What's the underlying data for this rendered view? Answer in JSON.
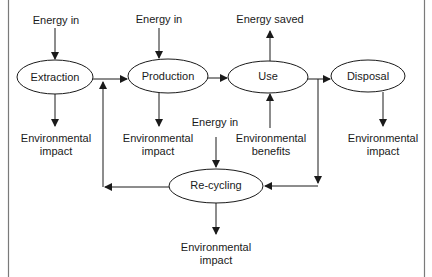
{
  "diagram": {
    "type": "flow",
    "nodes": {
      "extraction": "Extraction",
      "production": "Production",
      "use": "Use",
      "disposal": "Disposal",
      "recycling": "Re-cycling"
    },
    "labels": {
      "energy_in_extraction": "Energy in",
      "energy_in_production": "Energy in",
      "energy_in_recycling": "Energy in",
      "energy_saved": "Energy saved",
      "env_impact_extraction": [
        "Environmental",
        "impact"
      ],
      "env_impact_production": [
        "Environmental",
        "impact"
      ],
      "env_benefits_use": [
        "Environmental",
        "benefits"
      ],
      "env_impact_disposal": [
        "Environmental",
        "impact"
      ],
      "env_impact_recycling": [
        "Environmental",
        "impact"
      ]
    },
    "edges": [
      {
        "from": "Energy in",
        "to": "Extraction"
      },
      {
        "from": "Energy in",
        "to": "Production"
      },
      {
        "from": "Extraction",
        "to": "Production"
      },
      {
        "from": "Production",
        "to": "Use"
      },
      {
        "from": "Use",
        "to": "Disposal"
      },
      {
        "from": "Use",
        "to": "Energy saved"
      },
      {
        "from": "Environmental benefits",
        "to": "Use"
      },
      {
        "from": "Use",
        "to": "Re-cycling"
      },
      {
        "from": "Energy in",
        "to": "Re-cycling"
      },
      {
        "from": "Re-cycling",
        "to": "Production"
      },
      {
        "from": "Extraction",
        "to": "Environmental impact"
      },
      {
        "from": "Production",
        "to": "Environmental impact"
      },
      {
        "from": "Disposal",
        "to": "Environmental impact"
      },
      {
        "from": "Re-cycling",
        "to": "Environmental impact"
      }
    ],
    "colors": {
      "stroke": "#1a1a1a",
      "background": "#ffffff",
      "frame": "#808080"
    }
  }
}
